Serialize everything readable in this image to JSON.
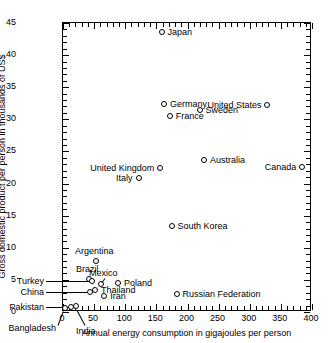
{
  "chart_data": {
    "type": "scatter",
    "title": "",
    "xlabel": "Annual energy consumption in gigajoules per person",
    "ylabel": "Gross domestic product per person in thousands of US$",
    "xlim": [
      0,
      400
    ],
    "ylim": [
      0,
      45
    ],
    "xticks": [
      0,
      50,
      100,
      150,
      200,
      250,
      300,
      350,
      400
    ],
    "yticks": [
      0,
      5,
      10,
      15,
      20,
      25,
      30,
      35,
      40,
      45
    ],
    "xtick_labels": [
      "0",
      "50",
      "100",
      "150",
      "200",
      "250",
      "300",
      "350",
      "400"
    ],
    "ytick_labels": [
      "0",
      "5",
      "10",
      "15",
      "20",
      "25",
      "30",
      "35",
      "40",
      "45"
    ],
    "x_minor_step": 10,
    "y_minor_step": 1,
    "grid": false,
    "legend": "none",
    "marker": "open-circle",
    "points": [
      {
        "name": "Japan",
        "x": 160,
        "y": 43.5,
        "label_side": "r"
      },
      {
        "name": "Germany",
        "x": 164,
        "y": 32.3,
        "label_side": "r"
      },
      {
        "name": "Sweden",
        "x": 221,
        "y": 31.3,
        "label_side": "r"
      },
      {
        "name": "France",
        "x": 173,
        "y": 30.3,
        "label_side": "r"
      },
      {
        "name": "United States",
        "x": 330,
        "y": 32.1,
        "label_side": "l"
      },
      {
        "name": "Australia",
        "x": 228,
        "y": 23.5,
        "label_side": "r"
      },
      {
        "name": "Canada",
        "x": 386,
        "y": 22.4,
        "label_side": "l"
      },
      {
        "name": "United Kingdom",
        "x": 158,
        "y": 22.2,
        "label_side": "l"
      },
      {
        "name": "Italy",
        "x": 123,
        "y": 20.7,
        "label_side": "l"
      },
      {
        "name": "South Korea",
        "x": 176,
        "y": 13.2,
        "label_side": "r"
      },
      {
        "name": "Argentina",
        "x": 55,
        "y": 7.8,
        "label_side": "above"
      },
      {
        "name": "Brazil",
        "x": 44,
        "y": 5.0,
        "label_side": "above"
      },
      {
        "name": "Mexico",
        "x": 63,
        "y": 4.2,
        "label_side": "above-leader"
      },
      {
        "name": "Poland",
        "x": 90,
        "y": 4.3,
        "label_side": "r"
      },
      {
        "name": "Thailand",
        "x": 53,
        "y": 3.3,
        "label_side": "r"
      },
      {
        "name": "Iran",
        "x": 68,
        "y": 2.3,
        "label_side": "r"
      },
      {
        "name": "Russian Federation",
        "x": 184,
        "y": 2.6,
        "label_side": "r"
      },
      {
        "name": "Turkey",
        "x": 48,
        "y": 4.6,
        "label_side": "leader-l"
      },
      {
        "name": "China",
        "x": 45,
        "y": 3.0,
        "label_side": "leader-l"
      },
      {
        "name": "Pakistan",
        "x": 14,
        "y": 0.6,
        "label_side": "leader-l"
      },
      {
        "name": "Bangladesh",
        "x": 5,
        "y": 0.4,
        "label_side": "leader-dl"
      },
      {
        "name": "India",
        "x": 22,
        "y": 0.8,
        "label_side": "leader-d"
      }
    ],
    "callout_labels": [
      {
        "text": "Turkey",
        "data_name": "point-label-turkey"
      },
      {
        "text": "China",
        "data_name": "point-label-china"
      },
      {
        "text": "Pakistan",
        "data_name": "point-label-pakistan"
      },
      {
        "text": "Bangladesh",
        "data_name": "point-label-bangladesh"
      },
      {
        "text": "India",
        "data_name": "point-label-india"
      }
    ],
    "colors": {
      "marker_edge": "#000000",
      "marker_fill": "#ffffff",
      "axis": "#000000",
      "background": "#ffffff",
      "text": "#000000"
    }
  }
}
